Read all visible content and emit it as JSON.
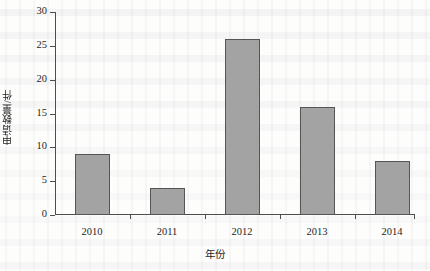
{
  "chart_data": {
    "type": "bar",
    "title": "",
    "subtitle": "",
    "categories": [
      "2010",
      "2011",
      "2012",
      "2013",
      "2014"
    ],
    "values": [
      9,
      4,
      26,
      16,
      8
    ],
    "series": [
      {
        "name": "申请数量",
        "values": [
          9,
          4,
          26,
          16,
          8
        ]
      }
    ],
    "xlabel": "年份",
    "ylabel": "申请数量/件",
    "ylim": [
      0,
      30
    ],
    "ytick_labels": [
      "0",
      "5",
      "10",
      "15",
      "20",
      "25",
      "30"
    ],
    "ytick_values": [
      0,
      5,
      10,
      15,
      20,
      25,
      30
    ],
    "xtick_labels": [
      "2010",
      "2011",
      "2012",
      "2013",
      "2014"
    ],
    "grid": false,
    "legend": false,
    "legend_position": "none",
    "bar_fill_color": "#a3a3a3",
    "bar_edge_color": "#555555",
    "axis_color": "#4d4d4d",
    "background_color": "#fdfdfc",
    "annotations": []
  }
}
